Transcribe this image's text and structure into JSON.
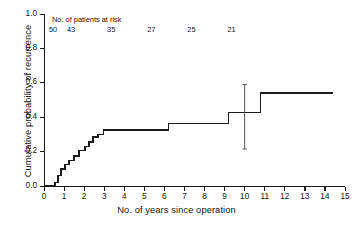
{
  "chart_data": {
    "type": "line",
    "subtype": "kaplan-meier-step",
    "title": "",
    "xlabel": "No. of years since operation",
    "ylabel": "Cumulative probability of recurrence",
    "xlim": [
      0,
      15
    ],
    "ylim": [
      0.0,
      1.0
    ],
    "grid": false,
    "legend": null,
    "xticks": [
      0,
      1,
      2,
      3,
      4,
      5,
      6,
      7,
      8,
      9,
      10,
      11,
      12,
      13,
      14,
      15
    ],
    "xticklabels": [
      "0",
      "1",
      "2",
      "3",
      "4",
      "5",
      "6",
      "7",
      "8",
      "9",
      "10",
      "11",
      "12",
      "13",
      "14",
      "15"
    ],
    "yticks": [
      0.0,
      0.2,
      0.4,
      0.6,
      0.8,
      1.0
    ],
    "yticklabels": [
      "0.0",
      "0.2",
      "0.4",
      "0.6",
      "0.8",
      "1.0"
    ],
    "series": [
      {
        "name": "Cumulative probability of recurrence",
        "color": "#1a1a1a",
        "step": "post",
        "points": [
          {
            "x": 0.0,
            "y": 0.0
          },
          {
            "x": 0.55,
            "y": 0.0
          },
          {
            "x": 0.55,
            "y": 0.02
          },
          {
            "x": 0.7,
            "y": 0.02
          },
          {
            "x": 0.7,
            "y": 0.06
          },
          {
            "x": 0.85,
            "y": 0.06
          },
          {
            "x": 0.85,
            "y": 0.1
          },
          {
            "x": 1.05,
            "y": 0.1
          },
          {
            "x": 1.05,
            "y": 0.125
          },
          {
            "x": 1.25,
            "y": 0.125
          },
          {
            "x": 1.25,
            "y": 0.15
          },
          {
            "x": 1.5,
            "y": 0.15
          },
          {
            "x": 1.5,
            "y": 0.175
          },
          {
            "x": 1.75,
            "y": 0.175
          },
          {
            "x": 1.75,
            "y": 0.205
          },
          {
            "x": 2.05,
            "y": 0.205
          },
          {
            "x": 2.05,
            "y": 0.23
          },
          {
            "x": 2.25,
            "y": 0.23
          },
          {
            "x": 2.25,
            "y": 0.255
          },
          {
            "x": 2.45,
            "y": 0.255
          },
          {
            "x": 2.45,
            "y": 0.285
          },
          {
            "x": 2.7,
            "y": 0.285
          },
          {
            "x": 2.7,
            "y": 0.3
          },
          {
            "x": 2.95,
            "y": 0.3
          },
          {
            "x": 2.95,
            "y": 0.325
          },
          {
            "x": 6.2,
            "y": 0.325
          },
          {
            "x": 6.2,
            "y": 0.365
          },
          {
            "x": 9.2,
            "y": 0.365
          },
          {
            "x": 9.2,
            "y": 0.428
          },
          {
            "x": 10.8,
            "y": 0.428
          },
          {
            "x": 10.8,
            "y": 0.54
          },
          {
            "x": 14.4,
            "y": 0.54
          }
        ]
      }
    ],
    "errorbars": [
      {
        "x": 10.0,
        "y": 0.428,
        "low": 0.215,
        "high": 0.59,
        "color": "#555555"
      }
    ],
    "at_risk": {
      "title": "No. of patients at risk",
      "x_positions": [
        0.0,
        0.9,
        2.9,
        4.9,
        6.9,
        8.9
      ],
      "counts": [
        "50",
        "43",
        "35",
        "27",
        "25",
        "21"
      ]
    }
  }
}
